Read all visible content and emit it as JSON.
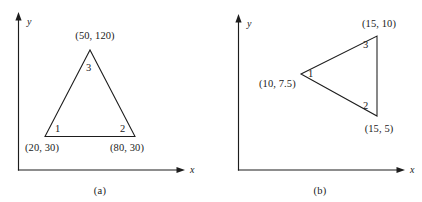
{
  "figure": {
    "panels": [
      {
        "id": "a",
        "caption": "(a)",
        "axes": {
          "x_label": "x",
          "y_label": "y"
        },
        "shape": "triangle",
        "vertices": [
          {
            "number": "1",
            "coordinate_label": "(20, 30)",
            "x": 20,
            "y": 30
          },
          {
            "number": "2",
            "coordinate_label": "(80, 30)",
            "x": 80,
            "y": 30
          },
          {
            "number": "3",
            "coordinate_label": "(50, 120)",
            "x": 50,
            "y": 120
          }
        ]
      },
      {
        "id": "b",
        "caption": "(b)",
        "axes": {
          "x_label": "x",
          "y_label": "y"
        },
        "shape": "triangle",
        "vertices": [
          {
            "number": "1",
            "coordinate_label": "(10, 7.5)",
            "x": 10,
            "y": 7.5
          },
          {
            "number": "2",
            "coordinate_label": "(15, 5)",
            "x": 15,
            "y": 5
          },
          {
            "number": "3",
            "coordinate_label": "(15, 10)",
            "x": 15,
            "y": 10
          }
        ]
      }
    ],
    "colors": {
      "ink": "#1d1d1d",
      "background": "#ffffff"
    }
  }
}
